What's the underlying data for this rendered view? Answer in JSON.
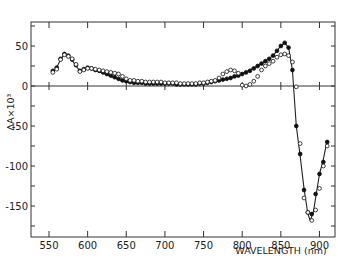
{
  "chart_data": {
    "type": "scatter",
    "title": "",
    "xlabel": "WAVELENGTH (nm)",
    "ylabel": "ΔA×10³",
    "xlim": [
      545,
      915
    ],
    "ylim": [
      -189,
      80
    ],
    "xticks": [
      550,
      600,
      650,
      700,
      750,
      800,
      850,
      900
    ],
    "yticks": [
      50,
      0,
      -50,
      -100,
      -150
    ],
    "grid": false,
    "zero_line": true,
    "series": [
      {
        "name": "filled circles",
        "marker": "filled-circle",
        "x": [
          555,
          560,
          565,
          570,
          575,
          580,
          585,
          590,
          595,
          600,
          605,
          610,
          615,
          620,
          625,
          630,
          635,
          640,
          645,
          650,
          655,
          660,
          665,
          670,
          675,
          680,
          685,
          690,
          695,
          700,
          705,
          710,
          715,
          720,
          725,
          730,
          735,
          740,
          745,
          750,
          755,
          760,
          765,
          770,
          775,
          780,
          785,
          790,
          795,
          800,
          805,
          810,
          815,
          820,
          825,
          830,
          835,
          840,
          845,
          850,
          855,
          860,
          865,
          870,
          875,
          880,
          885,
          890,
          895,
          900,
          905,
          910
        ],
        "values": [
          19,
          23,
          34,
          40,
          38,
          33,
          26,
          19,
          21,
          23,
          22,
          20,
          19,
          17,
          15,
          13,
          11,
          9,
          7,
          6,
          5,
          4,
          4,
          4,
          3,
          3,
          3,
          3,
          3,
          3,
          3,
          3,
          2,
          2,
          2,
          2,
          2,
          2,
          3,
          3,
          4,
          5,
          6,
          7,
          8,
          9,
          10,
          12,
          13,
          15,
          17,
          19,
          22,
          25,
          28,
          31,
          34,
          38,
          44,
          50,
          54,
          48,
          20,
          -50,
          -85,
          -130,
          -158,
          -160,
          -135,
          -110,
          -95,
          -70
        ]
      },
      {
        "name": "open circles",
        "marker": "open-circle",
        "x": [
          555,
          560,
          565,
          570,
          575,
          580,
          585,
          590,
          595,
          600,
          605,
          610,
          615,
          620,
          625,
          630,
          635,
          640,
          645,
          650,
          655,
          660,
          665,
          670,
          675,
          680,
          685,
          690,
          695,
          700,
          705,
          710,
          715,
          720,
          725,
          730,
          735,
          740,
          745,
          750,
          755,
          760,
          765,
          770,
          775,
          780,
          785,
          790,
          795,
          800,
          805,
          810,
          815,
          820,
          825,
          830,
          835,
          840,
          845,
          850,
          855,
          860,
          865,
          870,
          875,
          880,
          885,
          890,
          895,
          900,
          905,
          910
        ],
        "values": [
          17,
          21,
          33,
          39,
          37,
          34,
          27,
          18,
          20,
          22,
          22,
          21,
          20,
          19,
          18,
          17,
          16,
          15,
          12,
          9,
          7,
          7,
          6,
          6,
          5,
          5,
          5,
          5,
          5,
          4,
          4,
          4,
          4,
          3,
          3,
          3,
          3,
          3,
          4,
          4,
          5,
          6,
          7,
          10,
          15,
          18,
          20,
          19,
          16,
          1,
          0,
          2,
          6,
          12,
          20,
          25,
          28,
          31,
          36,
          39,
          40,
          38,
          30,
          -1,
          -72,
          -140,
          -158,
          -168,
          -155,
          -128,
          -100,
          -75
        ]
      }
    ],
    "curve": {
      "x": [
        553,
        560,
        565,
        570,
        575,
        580,
        585,
        590,
        595,
        600,
        605,
        610,
        620,
        630,
        640,
        650,
        660,
        680,
        700,
        720,
        740,
        760,
        780,
        800,
        820,
        840,
        850,
        855,
        860,
        865,
        870,
        875,
        880,
        885,
        888,
        892,
        900,
        905,
        910
      ],
      "values": [
        17,
        23,
        33,
        40,
        38,
        32,
        25,
        19,
        20,
        22,
        21,
        19,
        16,
        12,
        8,
        5,
        4,
        3,
        3,
        2,
        2,
        5,
        9,
        15,
        25,
        38,
        50,
        54,
        48,
        20,
        -50,
        -88,
        -128,
        -160,
        -168,
        -158,
        -110,
        -92,
        -68
      ]
    }
  }
}
